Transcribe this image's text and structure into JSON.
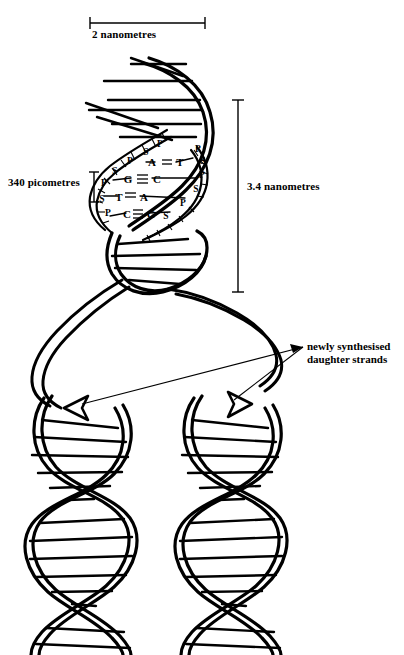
{
  "figure": {
    "background_color": "#ffffff",
    "ink_color": "#000000"
  },
  "scales": {
    "width_scale": {
      "label": "2 nanometres",
      "orientation": "horizontal"
    },
    "rise_scale": {
      "label": "340 picometres",
      "orientation": "vertical"
    },
    "pitch_scale": {
      "label": "3.4 nanometres",
      "orientation": "vertical"
    }
  },
  "annotations": {
    "daughter_strands": {
      "line1": "newly synthesised",
      "line2": "daughter strands"
    }
  },
  "base_pairs": [
    {
      "left": "A",
      "right": "T",
      "bond": "double"
    },
    {
      "left": "G",
      "right": "C",
      "bond": "triple"
    },
    {
      "left": "T",
      "right": "A",
      "bond": "double"
    },
    {
      "left": "C",
      "right": "G",
      "bond": "triple"
    }
  ],
  "backbone_labels": {
    "left_strand": [
      "P",
      "S",
      "P",
      "S",
      "P",
      "S",
      "P"
    ],
    "right_strand": [
      "P",
      "S",
      "P",
      "S",
      "P",
      "S"
    ],
    "sugar": "S",
    "phosphate": "P"
  }
}
